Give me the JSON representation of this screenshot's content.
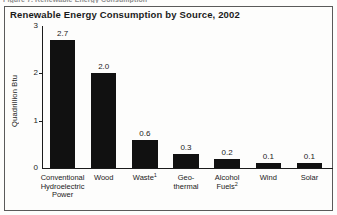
{
  "caption_sliver": "Figure 7. Renewable Energy Consumption",
  "figure": {
    "title": "Renewable Energy Consumption by Source, 2002",
    "y_axis_title": "Quadrillion Btu"
  },
  "chart_data": {
    "type": "bar",
    "title": "Renewable Energy Consumption by Source, 2002",
    "xlabel": "",
    "ylabel": "Quadrillion Btu",
    "ylim": [
      0,
      3
    ],
    "yticks": [
      "0",
      "1",
      "2",
      "3"
    ],
    "grid": false,
    "legend": null,
    "bar_color": "#111111",
    "categories": [
      "Conventional\nHydroelectric\nPower",
      "Wood",
      "Waste",
      "Geo-\nthermal",
      "Alcohol\nFuels",
      "Wind",
      "Solar"
    ],
    "category_footnotes": [
      "",
      "",
      "1",
      "",
      "2",
      "",
      ""
    ],
    "values": [
      2.7,
      2.0,
      0.6,
      0.3,
      0.2,
      0.1,
      0.1
    ],
    "value_labels": [
      "2.7",
      "2.0",
      "0.6",
      "0.3",
      "0.2",
      "0.1",
      "0.1"
    ]
  }
}
